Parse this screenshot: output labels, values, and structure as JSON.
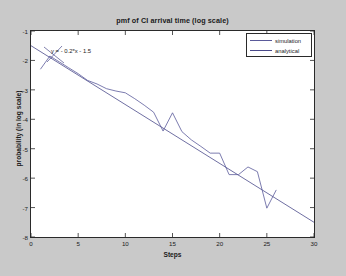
{
  "figure": {
    "background_color": "#c9c9c9",
    "plot_background_color": "#ffffff",
    "axis_color": "#2a2a2a"
  },
  "annotation": {
    "equation": "y = - 0.2*x - 1.5"
  },
  "legend": {
    "items": [
      {
        "label": "simulation",
        "color": "#5a5a9a"
      },
      {
        "label": "analytical",
        "color": "#4a4a8a"
      }
    ]
  },
  "yticks": [
    {
      "label": "-1",
      "value": -1
    },
    {
      "label": "-2",
      "value": -2
    },
    {
      "label": "-3",
      "value": -3
    },
    {
      "label": "-4",
      "value": -4
    },
    {
      "label": "-5",
      "value": -5
    },
    {
      "label": "-6",
      "value": -6
    },
    {
      "label": "-7",
      "value": -7
    },
    {
      "label": "-8",
      "value": -8
    }
  ],
  "xticks": [
    {
      "label": "0",
      "value": 0
    },
    {
      "label": "5",
      "value": 5
    },
    {
      "label": "10",
      "value": 10
    },
    {
      "label": "15",
      "value": 15
    },
    {
      "label": "20",
      "value": 20
    },
    {
      "label": "25",
      "value": 25
    },
    {
      "label": "30",
      "value": 30
    }
  ],
  "chart_data": {
    "type": "line",
    "title": "pmf of CI arrival time (log scale)",
    "xlabel": "Steps",
    "ylabel": "probability (in log scale)",
    "xlim": [
      0,
      30
    ],
    "ylim": [
      -8,
      -1
    ],
    "grid": false,
    "legend_position": "top-right",
    "annotations": [
      {
        "text": "y = - 0.2*x - 1.5",
        "x": 2.0,
        "y": -1.78
      }
    ],
    "series": [
      {
        "name": "simulation",
        "color": "#5a5a9a",
        "x": [
          1,
          2,
          3,
          4,
          5,
          6,
          7,
          8,
          9,
          10,
          11,
          12,
          13,
          14,
          15,
          16,
          17,
          18,
          19,
          20,
          21,
          22,
          23,
          24,
          25,
          26
        ],
        "y": [
          -2.3,
          -1.85,
          -2.05,
          -2.25,
          -2.45,
          -2.68,
          -2.8,
          -2.96,
          -3.04,
          -3.1,
          -3.3,
          -3.52,
          -3.76,
          -4.4,
          -3.78,
          -4.42,
          -4.7,
          -4.92,
          -5.15,
          -5.15,
          -5.88,
          -5.88,
          -5.62,
          -5.78,
          -7.02,
          -6.4
        ]
      },
      {
        "name": "analytical",
        "color": "#4a4a8a",
        "equation": "y = -0.2*x - 1.5",
        "slope": -0.2,
        "intercept": -1.5,
        "x": [
          0,
          30
        ],
        "y": [
          -1.5,
          -7.5
        ]
      }
    ]
  }
}
